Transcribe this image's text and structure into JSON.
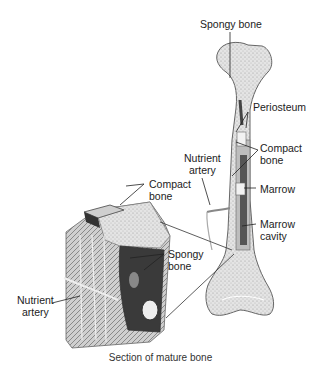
{
  "labels": {
    "spongy_bone_top": "Spongy bone",
    "periosteum": "Periosteum",
    "compact_bone_right": "Compact\nbone",
    "nutrient_artery_top": "Nutrient\nartery",
    "marrow": "Marrow",
    "marrow_cavity": "Marrow\ncavity",
    "compact_bone_left": "Compact\nbone",
    "spongy_bone_left": "Spongy\nbone",
    "nutrient_artery_left": "Nutrient\nartery"
  },
  "caption": "Section of mature bone"
}
